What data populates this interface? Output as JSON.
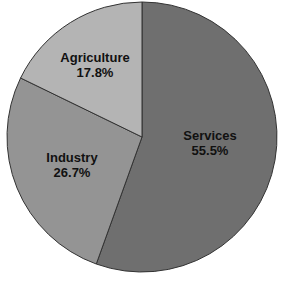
{
  "chart_data": {
    "type": "pie",
    "title": "",
    "categories": [
      "Services",
      "Industry",
      "Agriculture"
    ],
    "values": [
      55.5,
      26.7,
      17.8
    ],
    "labels": [
      "55.5%",
      "26.7%",
      "17.8%"
    ],
    "colors": [
      "#6f6f6f",
      "#949494",
      "#b4b4b4"
    ],
    "start_angle_deg": 0,
    "direction": "clockwise",
    "legend": "none",
    "stroke_color": "#333333"
  },
  "slices": [
    {
      "name": "Services",
      "value_label": "55.5%"
    },
    {
      "name": "Industry",
      "value_label": "26.7%"
    },
    {
      "name": "Agriculture",
      "value_label": "17.8%"
    }
  ]
}
